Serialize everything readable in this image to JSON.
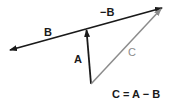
{
  "diagram": {
    "labels": {
      "b": "B",
      "neg_b": "−B",
      "a": "A",
      "c": "C",
      "equation": "C = A − B"
    },
    "colors": {
      "dark": "#1a1a1a",
      "gray": "#8c8c8c"
    }
  }
}
